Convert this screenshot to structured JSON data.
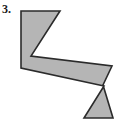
{
  "figure": {
    "label": "3.",
    "caption": "",
    "shape_name": "zigzag-polygon",
    "fill_color": "#b5b5b5",
    "stroke_color": "#2b2b2b",
    "stroke_width": 1.6,
    "background_color": "#ffffff",
    "canvas": {
      "width": 134,
      "height": 127
    },
    "vertices": [
      [
        21,
        11
      ],
      [
        60,
        11
      ],
      [
        31,
        56
      ],
      [
        112,
        66
      ],
      [
        103,
        85
      ],
      [
        113,
        118
      ],
      [
        84,
        118
      ],
      [
        104,
        86
      ],
      [
        21,
        68
      ]
    ],
    "points_attr": "21,11 60,11 31,56 112,66 103,85 113,118 84,118 104,86 21,68"
  }
}
